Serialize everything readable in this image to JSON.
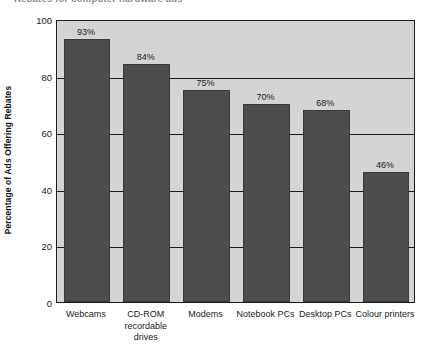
{
  "chart_data": {
    "type": "bar",
    "title": "Rebates for computer hardware ads",
    "title_clipped": true,
    "xlabel": "",
    "ylabel": "Percentage of Ads Offering Rebates",
    "categories": [
      "Webcams",
      "CD-ROM recordable drives",
      "Modems",
      "Notebook PCs",
      "Desktop PCs",
      "Colour printers"
    ],
    "category_lines": [
      [
        "Webcams"
      ],
      [
        "CD-ROM",
        "recordable",
        "drives"
      ],
      [
        "Modems"
      ],
      [
        "Notebook PCs"
      ],
      [
        "Desktop PCs"
      ],
      [
        "Colour printers"
      ]
    ],
    "values": [
      93,
      84,
      75,
      70,
      68,
      46
    ],
    "value_labels": [
      "93%",
      "84%",
      "75%",
      "70%",
      "68%",
      "46%"
    ],
    "ylim": [
      0,
      100
    ],
    "yticks": [
      0,
      20,
      40,
      60,
      80,
      100
    ],
    "ytick_labels": [
      "0",
      "20",
      "40",
      "60",
      "80",
      "100"
    ],
    "gridlines": [
      20,
      40,
      60,
      80
    ],
    "grid": true,
    "legend": null,
    "colors": {
      "bar": "#4d4d4d",
      "bar_border": "#3a3a3a",
      "plot_background": "#d4d4d4",
      "gridline": "#1a1a1a",
      "axis": "#1a1a1a",
      "text": "#1a1a1a",
      "page_background": "#ffffff"
    }
  }
}
